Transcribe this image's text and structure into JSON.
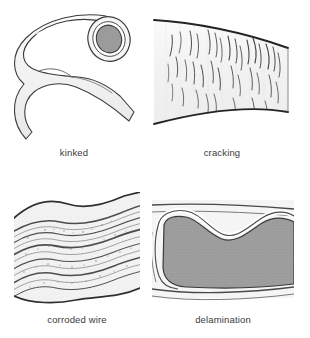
{
  "figure": {
    "kind": "illustration-grid",
    "background_color": "#ffffff",
    "rows": 2,
    "columns": 2,
    "caption_color": "#3a3a3a"
  },
  "panels": [
    {
      "id": "kinked",
      "caption": "kinked",
      "subject": "flexible tube bent sharply on itself showing open bore end",
      "icon": "kinked-tube-illustration",
      "line_color": "#3c3c3c",
      "body_fill": "#f4f4f4",
      "bore_fill": "#9a9a9a",
      "ring_fill": "#ffffff",
      "position": "top-left"
    },
    {
      "id": "cracking",
      "caption": "cracking",
      "subject": "tube wall surface covered with fine surface cracks",
      "icon": "cracked-surface-illustration",
      "line_color": "#2e2e2e",
      "body_fill": "#f3f3f3",
      "crack_color": "#4a4a4a",
      "position": "top-right"
    },
    {
      "id": "corroded_wire",
      "caption": "corroded wire",
      "subject": "braided reinforcement wire with corroded, frayed strands",
      "icon": "corroded-wire-illustration",
      "line_color": "#3a3a3a",
      "body_fill": "#f2f2f2",
      "strand_color": "#555555",
      "position": "bottom-left"
    },
    {
      "id": "delamination",
      "caption": "delamination",
      "subject": "cross-section of tube wall with inner layer separated from outer layer",
      "icon": "delamination-illustration",
      "line_color": "#3a3a3a",
      "outer_fill": "#f4f4f4",
      "core_fill": "#9c9c9c",
      "gap_fill": "#ffffff",
      "position": "bottom-right"
    }
  ]
}
